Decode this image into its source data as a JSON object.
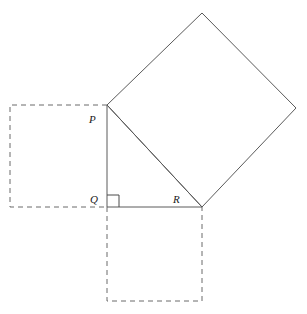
{
  "figure": {
    "canvas": {
      "width": 307,
      "height": 314,
      "background": "#ffffff"
    },
    "colors": {
      "solid_line": "#5a5a5a",
      "dashed_line": "#6b6b6b",
      "label_text": "#1a1a1a",
      "right_angle_mark": "#4a4a4a",
      "background": "#ffffff"
    },
    "vertices": {
      "P": {
        "label": "P",
        "x": 107,
        "y": 105,
        "label_x": 89,
        "label_y": 123
      },
      "Q": {
        "label": "Q",
        "x": 107,
        "y": 207,
        "label_x": 90,
        "label_y": 203
      },
      "R": {
        "label": "R",
        "x": 202,
        "y": 207,
        "label_x": 173,
        "label_y": 203
      }
    },
    "triangle": {
      "name": "right-triangle-PQR",
      "points": "107,105 107,207 202,207",
      "right_angle_at": "Q"
    },
    "right_angle_marker": {
      "name": "right-angle-marker-at-Q",
      "points": "107,195 119,195 119,207",
      "size": 12
    },
    "squares": [
      {
        "name": "square-on-leg-PQ",
        "side": "PQ",
        "style": "dashed",
        "points": "107,105 10,105 10,207 107,207"
      },
      {
        "name": "square-on-leg-QR",
        "side": "QR",
        "style": "dashed",
        "points": "107,207 107,301 202,301 202,207"
      },
      {
        "name": "square-on-hypotenuse-PR",
        "side": "PR",
        "style": "solid",
        "points": "107,105 202,13 296,108 202,207"
      }
    ],
    "edges": [
      {
        "name": "segment-PQ",
        "from": "P",
        "to": "Q",
        "style": "solid"
      },
      {
        "name": "segment-QR",
        "from": "Q",
        "to": "R",
        "style": "solid"
      },
      {
        "name": "segment-PR-hypotenuse",
        "from": "P",
        "to": "R",
        "style": "solid"
      }
    ]
  },
  "chart_data": {
    "type": "diagram",
    "labels": [
      "P",
      "Q",
      "R"
    ],
    "points": {
      "P": [
        107,
        105
      ],
      "Q": [
        107,
        207
      ],
      "R": [
        202,
        207
      ]
    },
    "derived_square_vertices": {
      "hypotenuse_square": [
        [
          107,
          105
        ],
        [
          202,
          13
        ],
        [
          296,
          108
        ],
        [
          202,
          207
        ]
      ],
      "leg_PQ_square": [
        [
          107,
          105
        ],
        [
          10,
          105
        ],
        [
          10,
          207
        ],
        [
          107,
          207
        ]
      ],
      "leg_QR_square": [
        [
          107,
          207
        ],
        [
          107,
          301
        ],
        [
          202,
          301
        ],
        [
          202,
          207
        ]
      ]
    },
    "side_lengths_px": {
      "PQ": 102,
      "QR": 95,
      "PR": 139.4
    },
    "grid": false,
    "legend": null,
    "xlabel": "",
    "ylabel": ""
  }
}
